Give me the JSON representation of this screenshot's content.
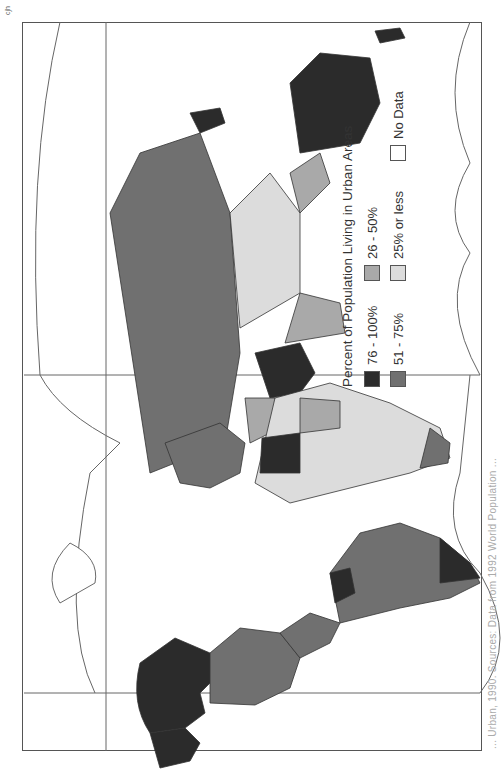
{
  "map": {
    "title": "Percent of Population Living in Urban Areas",
    "credit": "cjh",
    "caption": "... Urban, 1990.   Sources: Data from 1992 World Population ...",
    "orientation": "rotated 90 degrees counter-clockwise (landscape map on portrait page)"
  },
  "legend": {
    "title": "Percent of Population Living in Urban Areas",
    "items": [
      {
        "label": "76 - 100%",
        "color": "#2b2b2b"
      },
      {
        "label": "26 - 50%",
        "color": "#a9a9a9"
      },
      {
        "label": "51 - 75%",
        "color": "#707070"
      },
      {
        "label": "25% or less",
        "color": "#dcdcdc"
      },
      {
        "label": "No Data",
        "color": "#ffffff"
      }
    ]
  },
  "regions": [
    {
      "name": "United States",
      "class": "76 - 100%"
    },
    {
      "name": "Canada",
      "class": "76 - 100%"
    },
    {
      "name": "Mexico",
      "class": "51 - 75%"
    },
    {
      "name": "South America (most)",
      "class": "51 - 75%"
    },
    {
      "name": "Argentina / Chile / Uruguay",
      "class": "76 - 100%"
    },
    {
      "name": "Venezuela",
      "class": "76 - 100%"
    },
    {
      "name": "Former USSR",
      "class": "51 - 75%"
    },
    {
      "name": "Europe (most)",
      "class": "51 - 75%"
    },
    {
      "name": "Saudi Arabia",
      "class": "76 - 100%"
    },
    {
      "name": "Libya",
      "class": "76 - 100%"
    },
    {
      "name": "Africa (most)",
      "class": "25% or less"
    },
    {
      "name": "Africa (north/south)",
      "class": "26 - 50%"
    },
    {
      "name": "China",
      "class": "25% or less"
    },
    {
      "name": "India",
      "class": "26 - 50%"
    },
    {
      "name": "Australia",
      "class": "76 - 100%"
    },
    {
      "name": "Japan",
      "class": "76 - 100%"
    },
    {
      "name": "New Zealand",
      "class": "76 - 100%"
    },
    {
      "name": "Greenland",
      "class": "No Data"
    }
  ]
}
